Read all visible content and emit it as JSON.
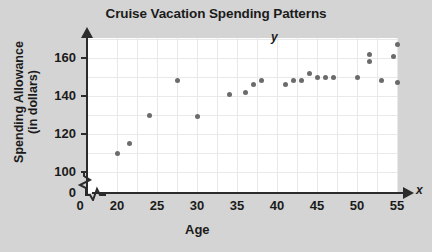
{
  "chart_data": {
    "type": "scatter",
    "title": "Cruise Vacation Spending Patterns",
    "xlabel": "Age",
    "ylabel": "Spending Allowance (in dollars)",
    "ylabel_line1": "Spending Allowance",
    "ylabel_line2": "(in dollars)",
    "x_axis_variable": "x",
    "y_axis_variable": "y",
    "xlim": [
      18,
      56
    ],
    "ylim": [
      95,
      172
    ],
    "grid": true,
    "legend": "none",
    "axis_break_x": true,
    "axis_break_y": true,
    "origin_label": "0",
    "y_origin_label": "0",
    "xticks": [
      20,
      25,
      30,
      35,
      40,
      45,
      50,
      55
    ],
    "xtick_labels": [
      "20",
      "25",
      "30",
      "35",
      "40",
      "45",
      "50",
      "55"
    ],
    "yticks": [
      100,
      120,
      140,
      160
    ],
    "ytick_labels": [
      "100",
      "120",
      "140",
      "160"
    ],
    "point_color": "#6b6b6b",
    "points": [
      {
        "x": 20.0,
        "y": 110
      },
      {
        "x": 21.5,
        "y": 115
      },
      {
        "x": 24.0,
        "y": 130
      },
      {
        "x": 27.5,
        "y": 148
      },
      {
        "x": 30.0,
        "y": 129
      },
      {
        "x": 34.0,
        "y": 141
      },
      {
        "x": 36.0,
        "y": 142
      },
      {
        "x": 37.0,
        "y": 146
      },
      {
        "x": 38.0,
        "y": 148
      },
      {
        "x": 41.0,
        "y": 146
      },
      {
        "x": 42.0,
        "y": 148
      },
      {
        "x": 43.0,
        "y": 148
      },
      {
        "x": 44.0,
        "y": 152
      },
      {
        "x": 45.0,
        "y": 150
      },
      {
        "x": 46.0,
        "y": 150
      },
      {
        "x": 47.0,
        "y": 150
      },
      {
        "x": 50.0,
        "y": 150
      },
      {
        "x": 51.5,
        "y": 162
      },
      {
        "x": 51.5,
        "y": 158
      },
      {
        "x": 53.0,
        "y": 148
      },
      {
        "x": 54.5,
        "y": 161
      },
      {
        "x": 55.0,
        "y": 167
      },
      {
        "x": 55.0,
        "y": 147
      }
    ]
  }
}
